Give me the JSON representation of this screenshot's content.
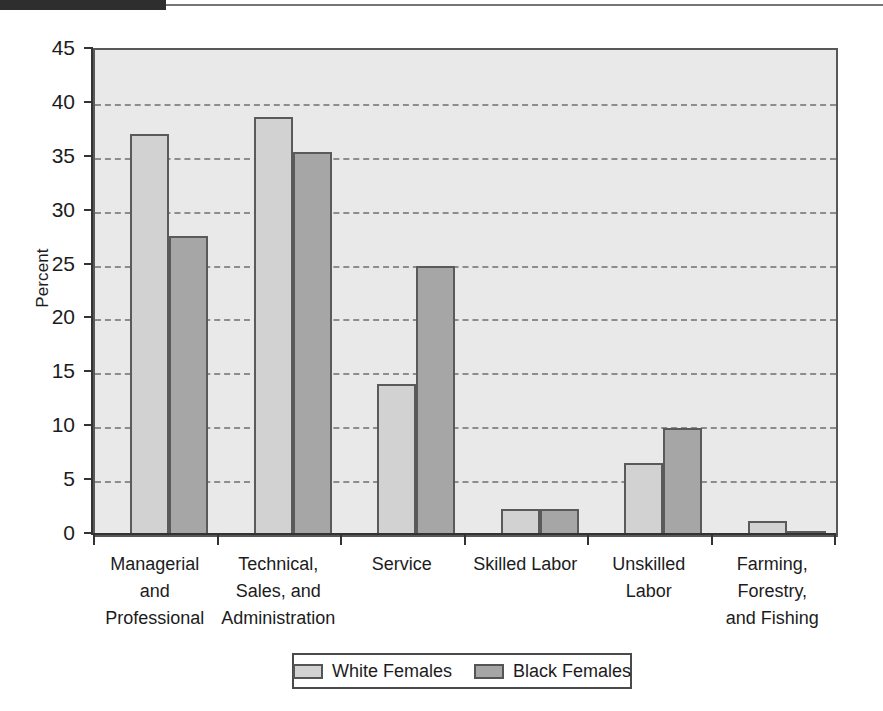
{
  "decor": {
    "top_bar_color": "#2e2e2e",
    "top_rule_color": "#767676"
  },
  "chart_data": {
    "type": "bar",
    "title": "",
    "subtitle": "",
    "xlabel": "",
    "ylabel": "Percent",
    "ylim": [
      0,
      45
    ],
    "ytick_step": 5,
    "yticks": [
      45,
      40,
      35,
      30,
      25,
      20,
      15,
      10,
      5,
      0
    ],
    "grid": true,
    "grid_axis": "y",
    "legend_position": "bottom",
    "categories": [
      "Managerial and Professional",
      "Technical, Sales, and Administration",
      "Service",
      "Skilled Labor",
      "Unskilled Labor",
      "Farming, Forestry, and Fishing"
    ],
    "category_lines": [
      [
        "Managerial",
        "and",
        "Professional"
      ],
      [
        "Technical,",
        "Sales, and",
        "Administration"
      ],
      [
        "Service"
      ],
      [
        "Skilled Labor"
      ],
      [
        "Unskilled",
        "Labor"
      ],
      [
        "Farming,",
        "Forestry,",
        "and Fishing"
      ]
    ],
    "series": [
      {
        "name": "White Females",
        "color": "#d2d2d2",
        "values": [
          37.2,
          38.8,
          14.0,
          2.4,
          6.7,
          1.3
        ]
      },
      {
        "name": "Black Females",
        "color": "#a6a6a6",
        "values": [
          27.7,
          35.5,
          25.0,
          2.4,
          9.9,
          0.2
        ]
      }
    ]
  },
  "legend": {
    "entries": [
      {
        "label": "White Females",
        "series": "white"
      },
      {
        "label": "Black Females",
        "series": "black"
      }
    ]
  }
}
